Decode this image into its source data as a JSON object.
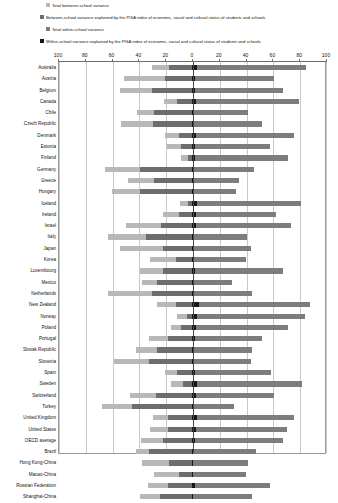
{
  "legend": {
    "items": [
      {
        "label": "Total between-school variance",
        "color": "#b8b8b8"
      },
      {
        "label": "Between-school variance explained by the PISA index of economic, social and cultural status of students and schools",
        "color": "#6d6d6d"
      },
      {
        "label": "Total within-school variance",
        "color": "#7d7d7d"
      },
      {
        "label": "Within-school variance explained by the PISA index of economic, social and cultural status of students and schools",
        "color": "#161616"
      }
    ]
  },
  "axis": {
    "ticks": [
      "100",
      "80",
      "60",
      "40",
      "20",
      "0",
      "20",
      "40",
      "60",
      "80",
      "100"
    ]
  },
  "chart_data": {
    "type": "bar",
    "title": "",
    "subtitle": "",
    "xlabel": "",
    "ylabel": "",
    "orientation": "horizontal-diverging",
    "xlim": [
      -100,
      100
    ],
    "grid": true,
    "legend_position": "top",
    "axis_ticks": [
      100,
      80,
      60,
      40,
      20,
      0,
      20,
      40,
      60,
      80,
      100
    ],
    "note": "Left side shows between-school variance (total, and part explained by ESCS); right side shows within-school variance (total, and part explained by ESCS). All values are percentages of the OECD average total variance in reading performance.",
    "categories": [
      "Australia",
      "Austria",
      "Belgium",
      "Canada",
      "Chile",
      "Czech Republic",
      "Denmark",
      "Estonia",
      "Finland",
      "Germany",
      "Greece",
      "Hungary",
      "Iceland",
      "Ireland",
      "Israel",
      "Italy",
      "Japan",
      "Korea",
      "Luxembourg",
      "Mexico",
      "Netherlands",
      "New Zealand",
      "Norway",
      "Poland",
      "Portugal",
      "Slovak Republic",
      "Slovenia",
      "Spain",
      "Sweden",
      "Switzerland",
      "Turkey",
      "United Kingdom",
      "United States",
      "OECD average",
      "Brazil",
      "Hong Kong-China",
      "Macao-China",
      "Russian Federation",
      "Shanghai-China"
    ],
    "series": [
      {
        "name": "Total between-school variance",
        "side": "left",
        "color": "#b8b8b8",
        "values": [
          30,
          51,
          54,
          21,
          41,
          53,
          20,
          19,
          8,
          65,
          48,
          60,
          9,
          22,
          49,
          63,
          54,
          31,
          39,
          37,
          63,
          26,
          11,
          16,
          32,
          42,
          58,
          20,
          16,
          46,
          67,
          29,
          31,
          38,
          42,
          37,
          28,
          33,
          39
        ]
      },
      {
        "name": "Between-school variance explained by the PISA index of economic, social and cultural status of students and schools",
        "side": "left",
        "color": "#6d6d6d",
        "values": [
          17,
          20,
          30,
          11,
          28,
          29,
          10,
          8,
          3,
          39,
          28,
          39,
          3,
          10,
          23,
          34,
          22,
          12,
          22,
          26,
          30,
          12,
          4,
          8,
          18,
          26,
          32,
          11,
          7,
          27,
          45,
          18,
          18,
          22,
          32,
          17,
          10,
          18,
          24
        ]
      },
      {
        "name": "Total within-school variance",
        "side": "right",
        "color": "#7d7d7d",
        "values": [
          85,
          61,
          68,
          80,
          42,
          52,
          76,
          58,
          72,
          46,
          35,
          33,
          81,
          63,
          74,
          41,
          44,
          40,
          68,
          30,
          45,
          88,
          84,
          72,
          52,
          45,
          44,
          59,
          82,
          61,
          31,
          76,
          71,
          68,
          48,
          42,
          40,
          58,
          45
        ]
      },
      {
        "name": "Within-school variance explained by the PISA index of economic, social and cultural status of students and schools",
        "side": "right",
        "color": "#161616",
        "values": [
          4,
          2,
          2,
          3,
          1,
          1,
          3,
          2,
          2,
          1,
          1,
          1,
          4,
          3,
          3,
          1,
          1,
          1,
          2,
          1,
          1,
          5,
          4,
          3,
          2,
          1,
          1,
          2,
          4,
          3,
          1,
          4,
          3,
          2,
          1,
          1,
          1,
          2,
          1
        ]
      }
    ]
  }
}
